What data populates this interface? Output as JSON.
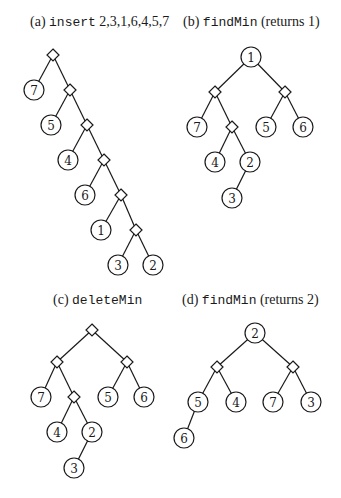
{
  "panels": [
    {
      "id": "a",
      "caption": {
        "prefix": "(a) ",
        "code": "insert",
        "suffix": " 2,3,1,6,4,5,7",
        "x": 30,
        "y": 14
      },
      "nodes": [
        {
          "id": "d0",
          "type": "diamond",
          "x": 53,
          "y": 55
        },
        {
          "id": "n7",
          "type": "circle",
          "label": "7",
          "x": 34,
          "y": 90
        },
        {
          "id": "d1",
          "type": "diamond",
          "x": 70,
          "y": 90
        },
        {
          "id": "n5",
          "type": "circle",
          "label": "5",
          "x": 51,
          "y": 125
        },
        {
          "id": "d2",
          "type": "diamond",
          "x": 87,
          "y": 125
        },
        {
          "id": "n4",
          "type": "circle",
          "label": "4",
          "x": 68,
          "y": 160
        },
        {
          "id": "d3",
          "type": "diamond",
          "x": 104,
          "y": 160
        },
        {
          "id": "n6",
          "type": "circle",
          "label": "6",
          "x": 85,
          "y": 195
        },
        {
          "id": "d4",
          "type": "diamond",
          "x": 121,
          "y": 195
        },
        {
          "id": "n1",
          "type": "circle",
          "label": "1",
          "x": 101,
          "y": 230
        },
        {
          "id": "d5",
          "type": "diamond",
          "x": 136,
          "y": 230
        },
        {
          "id": "n3",
          "type": "circle",
          "label": "3",
          "x": 118,
          "y": 265
        },
        {
          "id": "n2",
          "type": "circle",
          "label": "2",
          "x": 153,
          "y": 265
        }
      ],
      "edges": [
        [
          "d0",
          "n7"
        ],
        [
          "d0",
          "d1"
        ],
        [
          "d1",
          "n5"
        ],
        [
          "d1",
          "d2"
        ],
        [
          "d2",
          "n4"
        ],
        [
          "d2",
          "d3"
        ],
        [
          "d3",
          "n6"
        ],
        [
          "d3",
          "d4"
        ],
        [
          "d4",
          "n1"
        ],
        [
          "d4",
          "d5"
        ],
        [
          "d5",
          "n3"
        ],
        [
          "d5",
          "n2"
        ]
      ]
    },
    {
      "id": "b",
      "caption": {
        "prefix": "(b) ",
        "code": "findMin",
        "suffix": " (returns 1)",
        "x": 183,
        "y": 14
      },
      "nodes": [
        {
          "id": "r1",
          "type": "circle",
          "label": "1",
          "x": 251,
          "y": 57
        },
        {
          "id": "dl",
          "type": "diamond",
          "x": 215,
          "y": 92
        },
        {
          "id": "dr",
          "type": "diamond",
          "x": 285,
          "y": 92
        },
        {
          "id": "n7",
          "type": "circle",
          "label": "7",
          "x": 197,
          "y": 127
        },
        {
          "id": "dlr",
          "type": "diamond",
          "x": 232,
          "y": 127
        },
        {
          "id": "n5",
          "type": "circle",
          "label": "5",
          "x": 266,
          "y": 127
        },
        {
          "id": "n6",
          "type": "circle",
          "label": "6",
          "x": 303,
          "y": 127
        },
        {
          "id": "n4",
          "type": "circle",
          "label": "4",
          "x": 215,
          "y": 162
        },
        {
          "id": "n2",
          "type": "circle",
          "label": "2",
          "x": 250,
          "y": 162
        },
        {
          "id": "n3",
          "type": "circle",
          "label": "3",
          "x": 232,
          "y": 198
        }
      ],
      "edges": [
        [
          "r1",
          "dl"
        ],
        [
          "r1",
          "dr"
        ],
        [
          "dl",
          "n7"
        ],
        [
          "dl",
          "dlr"
        ],
        [
          "dr",
          "n5"
        ],
        [
          "dr",
          "n6"
        ],
        [
          "dlr",
          "n4"
        ],
        [
          "dlr",
          "n2"
        ],
        [
          "n2",
          "n3"
        ]
      ]
    },
    {
      "id": "c",
      "caption": {
        "prefix": "(c) ",
        "code": "deleteMin",
        "suffix": "",
        "x": 53,
        "y": 292
      },
      "nodes": [
        {
          "id": "d0",
          "type": "diamond",
          "x": 92,
          "y": 330
        },
        {
          "id": "dl",
          "type": "diamond",
          "x": 57,
          "y": 362
        },
        {
          "id": "dr",
          "type": "diamond",
          "x": 127,
          "y": 362
        },
        {
          "id": "n7",
          "type": "circle",
          "label": "7",
          "x": 41,
          "y": 397
        },
        {
          "id": "dlr",
          "type": "diamond",
          "x": 74,
          "y": 397
        },
        {
          "id": "n5",
          "type": "circle",
          "label": "5",
          "x": 108,
          "y": 397
        },
        {
          "id": "n6",
          "type": "circle",
          "label": "6",
          "x": 144,
          "y": 397
        },
        {
          "id": "n4",
          "type": "circle",
          "label": "4",
          "x": 57,
          "y": 432
        },
        {
          "id": "n2",
          "type": "circle",
          "label": "2",
          "x": 92,
          "y": 432
        },
        {
          "id": "n3",
          "type": "circle",
          "label": "3",
          "x": 74,
          "y": 468
        }
      ],
      "edges": [
        [
          "d0",
          "dl"
        ],
        [
          "d0",
          "dr"
        ],
        [
          "dl",
          "n7"
        ],
        [
          "dl",
          "dlr"
        ],
        [
          "dr",
          "n5"
        ],
        [
          "dr",
          "n6"
        ],
        [
          "dlr",
          "n4"
        ],
        [
          "dlr",
          "n2"
        ],
        [
          "n2",
          "n3"
        ]
      ]
    },
    {
      "id": "d",
      "caption": {
        "prefix": "(d) ",
        "code": "findMin",
        "suffix": " (returns 2)",
        "x": 182,
        "y": 292
      },
      "nodes": [
        {
          "id": "r2",
          "type": "circle",
          "label": "2",
          "x": 255,
          "y": 333
        },
        {
          "id": "dl",
          "type": "diamond",
          "x": 217,
          "y": 367
        },
        {
          "id": "dr",
          "type": "diamond",
          "x": 293,
          "y": 367
        },
        {
          "id": "n5",
          "type": "circle",
          "label": "5",
          "x": 198,
          "y": 402
        },
        {
          "id": "n4",
          "type": "circle",
          "label": "4",
          "x": 236,
          "y": 402
        },
        {
          "id": "n7",
          "type": "circle",
          "label": "7",
          "x": 273,
          "y": 402
        },
        {
          "id": "n3",
          "type": "circle",
          "label": "3",
          "x": 311,
          "y": 402
        },
        {
          "id": "n6",
          "type": "circle",
          "label": "6",
          "x": 184,
          "y": 438
        }
      ],
      "edges": [
        [
          "r2",
          "dl"
        ],
        [
          "r2",
          "dr"
        ],
        [
          "dl",
          "n5"
        ],
        [
          "dl",
          "n4"
        ],
        [
          "dr",
          "n7"
        ],
        [
          "dr",
          "n3"
        ],
        [
          "n5",
          "n6"
        ]
      ]
    }
  ],
  "style": {
    "stroke": "#1a1a1a",
    "fill": "#ffffff",
    "circle_radius": 10,
    "diamond_half": 6
  }
}
